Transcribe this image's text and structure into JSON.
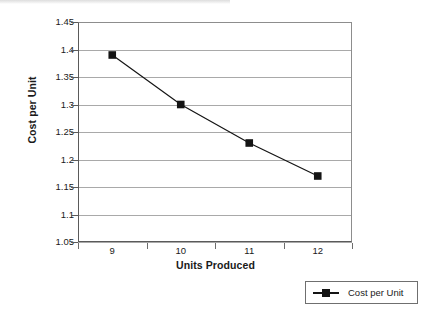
{
  "chart_data": {
    "type": "line",
    "title": "",
    "xlabel": "Units Produced",
    "ylabel": "Cost per Unit",
    "categories": [
      "9",
      "10",
      "11",
      "12"
    ],
    "series": [
      {
        "name": "Cost per Unit",
        "values": [
          1.39,
          1.3,
          1.23,
          1.17
        ],
        "marker": "square",
        "color": "#141414"
      }
    ],
    "ylim": [
      1.05,
      1.45
    ],
    "ytick_labels": [
      "1.45",
      "1.4",
      "1.35",
      "1.3",
      "1.25",
      "1.2",
      "1.15",
      "1.1",
      "1.05"
    ],
    "ytick_values": [
      1.45,
      1.4,
      1.35,
      1.3,
      1.25,
      1.2,
      1.15,
      1.1,
      1.05
    ],
    "grid": "horizontal",
    "legend_position": "bottom-right",
    "legend_entries": [
      "Cost per Unit"
    ],
    "gridline_color": "#a9a9a9",
    "axis_color": "#5a5a5a",
    "background": "#ffffff"
  },
  "legend": {
    "label": "Cost per Unit"
  }
}
